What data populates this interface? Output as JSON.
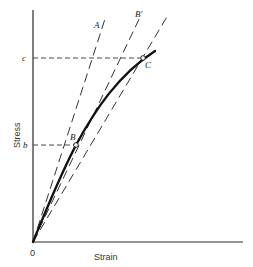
{
  "diagram": {
    "axes": {
      "x_label": "Strain",
      "y_label": "Stress",
      "origin_label": "0"
    },
    "y_ticks": [
      {
        "label": "b",
        "stress_level": "b"
      },
      {
        "label": "c",
        "stress_level": "c"
      }
    ],
    "lines": [
      {
        "id": "A",
        "label": "A",
        "type": "dashed",
        "description": "initial tangent line from origin"
      },
      {
        "id": "B-prime",
        "label": "B′",
        "type": "dashed",
        "description": "secant line from origin through B"
      },
      {
        "id": "C-line",
        "label": "",
        "type": "dashed",
        "description": "secant line from origin through C"
      }
    ],
    "points": [
      {
        "label": "B",
        "on": "curve",
        "stress": "b"
      },
      {
        "label": "C",
        "on": "curve",
        "stress": "c"
      }
    ],
    "curve": {
      "label": "stress-strain curve",
      "style": "solid bold"
    }
  }
}
